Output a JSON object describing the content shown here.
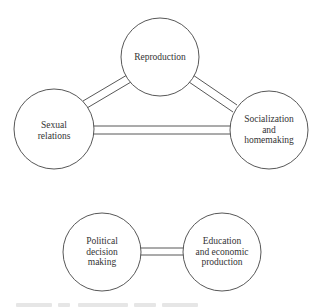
{
  "diagram": {
    "colors": {
      "stroke": "#444444",
      "text": "#333333",
      "background": "#ffffff"
    },
    "nodes": [
      {
        "id": "reproduction",
        "label": "Reproduction",
        "cx": 160,
        "cy": 57,
        "r": 39
      },
      {
        "id": "sexual",
        "label": "Sexual\nrelations",
        "line1": "Sexual",
        "line2": "relations",
        "cx": 54,
        "cy": 129,
        "r": 40
      },
      {
        "id": "socialization",
        "line1": "Socialization",
        "line2": "and",
        "line3": "homemaking",
        "cx": 269,
        "cy": 130,
        "r": 39
      },
      {
        "id": "political",
        "line1": "Political",
        "line2": "decision",
        "line3": "making",
        "cx": 102,
        "cy": 252,
        "r": 39
      },
      {
        "id": "education",
        "line1": "Education",
        "line2": "and economic",
        "line3": "production",
        "cx": 222,
        "cy": 252,
        "r": 39
      }
    ],
    "edges": [
      {
        "from": "sexual",
        "to": "reproduction",
        "style": "double-line"
      },
      {
        "from": "reproduction",
        "to": "socialization",
        "style": "double-line"
      },
      {
        "from": "sexual",
        "to": "socialization",
        "style": "double-line"
      },
      {
        "from": "political",
        "to": "education",
        "style": "double-line"
      }
    ]
  }
}
